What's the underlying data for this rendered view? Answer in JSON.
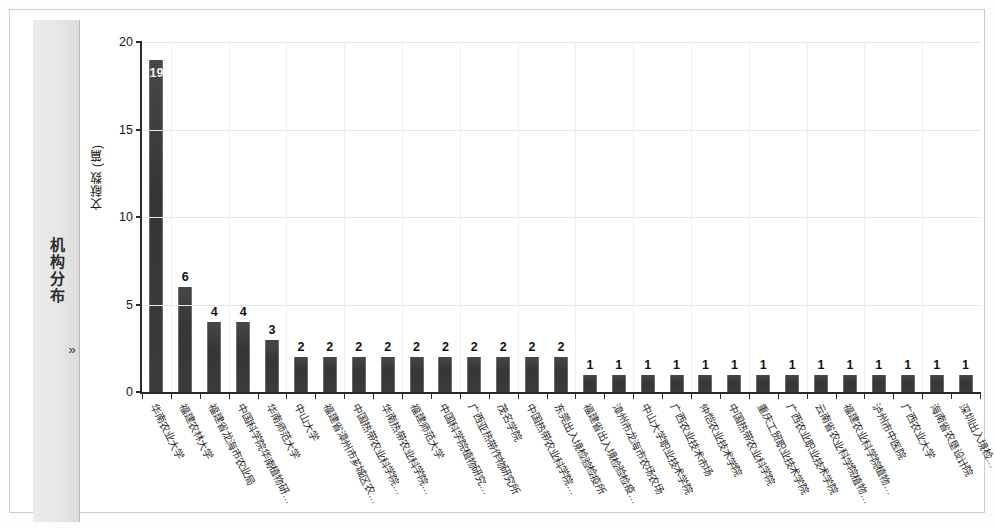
{
  "sidebar": {
    "label": "机构分布",
    "expand_icon": "chevron-double-right-icon",
    "expand_label": "»"
  },
  "chart_data": {
    "type": "bar",
    "title": "",
    "xlabel": "",
    "ylabel": "文献数 (篇)",
    "ylim": [
      0,
      20
    ],
    "yticks": [
      0,
      5,
      10,
      15,
      20
    ],
    "grid": true,
    "legend": "none",
    "orientation": "vertical",
    "bar_color": "#3a3a3a",
    "categories": [
      "华南农业大学",
      "福建农林大学",
      "福建省龙海市农业局",
      "中国科学院华南植物研…",
      "华南师范大学",
      "中山大学",
      "福建省漳州市芗城区农…",
      "中国热带农业科学院…",
      "华南热带农业科学院…",
      "福建师范大学",
      "中国科学院植物研究…",
      "广西亚热带作物研究所",
      "茂名学院",
      "中国热带农业科学院…",
      "东莞出入境检验检疫所",
      "福建省出入境检验检疫…",
      "漳州市龙海市农场农场",
      "中山大学职业技术学院",
      "广西农业技术市场",
      "仲恺农业技术学院",
      "中国热带农业科学院",
      "重庆工贸职业技术学院",
      "广西农业职业技术学院",
      "云南省农业科学院植物…",
      "福建农业科学院植物…",
      "泸州市中医院",
      "广西农业大学",
      "海南省农垦设计院",
      "深圳出入境检…"
    ],
    "values": [
      19,
      6,
      4,
      4,
      3,
      2,
      2,
      2,
      2,
      2,
      2,
      2,
      2,
      2,
      2,
      1,
      1,
      1,
      1,
      1,
      1,
      1,
      1,
      1,
      1,
      1,
      1,
      1,
      1
    ],
    "value_labels": [
      "19",
      "6",
      "4",
      "4",
      "3",
      "2",
      "2",
      "2",
      "2",
      "2",
      "2",
      "2",
      "2",
      "2",
      "2",
      "1",
      "1",
      "1",
      "1",
      "1",
      "1",
      "1",
      "1",
      "1",
      "1",
      "1",
      "1",
      "1",
      "1"
    ]
  }
}
